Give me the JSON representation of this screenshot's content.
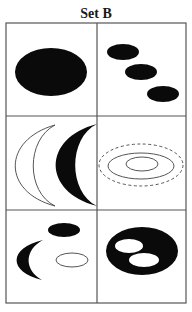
{
  "title": "Set B",
  "colors": {
    "grid": "#555555",
    "fill": "#0a0a0a",
    "stroke": "#555555",
    "background": "#ffffff"
  },
  "grid": {
    "x0": 6,
    "x1": 186,
    "xmid": 97,
    "y0": 23,
    "y1": 303,
    "rows": [
      116,
      210
    ]
  },
  "cells": [
    {
      "id": "cell-1",
      "shapes": [
        {
          "kind": "ellipse",
          "name": "large-black-ellipse",
          "cx": 51,
          "cy": 72,
          "rx": 36,
          "ry": 24,
          "fill": "black"
        }
      ]
    },
    {
      "id": "cell-2",
      "shapes": [
        {
          "kind": "ellipse",
          "name": "small-black-ellipse-1",
          "cx": 123,
          "cy": 52,
          "rx": 16,
          "ry": 8,
          "fill": "black"
        },
        {
          "kind": "ellipse",
          "name": "small-black-ellipse-2",
          "cx": 141,
          "cy": 72,
          "rx": 16,
          "ry": 8,
          "fill": "black"
        },
        {
          "kind": "ellipse",
          "name": "small-black-ellipse-3",
          "cx": 163,
          "cy": 94,
          "rx": 16,
          "ry": 8,
          "fill": "black"
        }
      ]
    },
    {
      "id": "cell-3",
      "shapes": [
        {
          "kind": "path",
          "name": "outline-crescent",
          "d": "M55 125 C 2 140, 2 192, 55 206 C 26 192, 26 140, 55 125 Z",
          "fill": "none"
        },
        {
          "kind": "path",
          "name": "black-crescent",
          "d": "M97 124 C 42 138, 42 192, 97 206 C 68 192, 68 138, 97 124 Z",
          "fill": "black"
        }
      ]
    },
    {
      "id": "cell-4",
      "shapes": [
        {
          "kind": "ellipse",
          "name": "dashed-outer-ellipse",
          "cx": 141,
          "cy": 165,
          "rx": 42,
          "ry": 21,
          "fill": "none",
          "dashed": true
        },
        {
          "kind": "ellipse",
          "name": "middle-outline-ellipse",
          "cx": 141,
          "cy": 166,
          "rx": 33,
          "ry": 13,
          "fill": "none"
        },
        {
          "kind": "ellipse",
          "name": "inner-outline-ellipse",
          "cx": 142,
          "cy": 164,
          "rx": 16,
          "ry": 7,
          "fill": "none"
        }
      ]
    },
    {
      "id": "cell-5",
      "shapes": [
        {
          "kind": "ellipse",
          "name": "small-black-ellipse",
          "cx": 64,
          "cy": 230,
          "rx": 16,
          "ry": 7,
          "fill": "black"
        },
        {
          "kind": "path",
          "name": "small-black-crescent",
          "d": "M43 240 C 8 248, 8 272, 42 280 C 24 270, 24 250, 43 240 Z",
          "fill": "black"
        },
        {
          "kind": "ellipse",
          "name": "small-outline-ellipse",
          "cx": 72,
          "cy": 260,
          "rx": 16,
          "ry": 7,
          "fill": "none"
        }
      ]
    },
    {
      "id": "cell-6",
      "shapes": [
        {
          "kind": "ellipse",
          "name": "large-black-ellipse",
          "cx": 142,
          "cy": 251,
          "rx": 36,
          "ry": 24,
          "fill": "black"
        },
        {
          "kind": "ellipse",
          "name": "white-hole-ellipse-1",
          "cx": 129,
          "cy": 246,
          "rx": 14,
          "ry": 7,
          "fill": "white"
        },
        {
          "kind": "ellipse",
          "name": "white-hole-ellipse-2",
          "cx": 144,
          "cy": 260,
          "rx": 15,
          "ry": 7,
          "fill": "white"
        }
      ]
    }
  ]
}
